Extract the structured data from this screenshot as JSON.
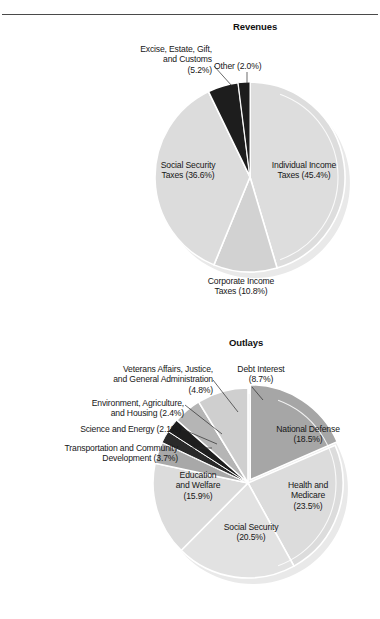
{
  "page": {
    "background_color": "#ffffff",
    "rule_color": "#4a4a4a"
  },
  "charts": [
    {
      "id": "revenues",
      "title": "Revenues"
    },
    {
      "id": "outlays",
      "title": "Outlays"
    }
  ],
  "revenues_labels": {
    "excise": "Excise, Estate, Gift,\nand Customs\n(5.2%)",
    "other": "Other (2.0%)",
    "social_security": "Social Security\nTaxes (36.6%)",
    "individual": "Individual Income\nTaxes (45.4%)",
    "corporate": "Corporate Income\nTaxes (10.8%)"
  },
  "outlays_labels": {
    "veterans": "Veterans Affairs, Justice,\nand General Administration\n(4.8%)",
    "debt_interest": "Debt Interest\n(8.7%)",
    "environment": "Environment, Agriculture,\nand Housing (2.4%)",
    "science": "Science and Energy (2.1%)",
    "transportation": "Transportation and Community\nDevelopment (3.7%)",
    "national_defense": "National Defense\n(18.5%)",
    "health": "Health and\nMedicare\n(23.5%)",
    "social_security": "Social Security\n(20.5%)",
    "education": "Education\nand Welfare\n(15.9%)"
  },
  "chart_data": [
    {
      "type": "pie",
      "title": "Revenues",
      "legend_position": "callout-labels",
      "categories": [
        "Individual Income Taxes",
        "Corporate Income Taxes",
        "Social Security Taxes",
        "Excise, Estate, Gift, and Customs",
        "Other"
      ],
      "values": [
        45.4,
        10.8,
        36.6,
        5.2,
        2.0
      ],
      "value_unit": "percent",
      "labels": [
        "Individual Income Taxes (45.4%)",
        "Corporate Income Taxes (10.8%)",
        "Social Security Taxes (36.6%)",
        "Excise, Estate, Gift, and Customs (5.2%)",
        "Other (2.0%)"
      ],
      "colors": [
        "#dddddd",
        "#d2d2d2",
        "#dcdcdc",
        "#1d1d1d",
        "#1d1d1d"
      ],
      "start_angle_deg": 0,
      "direction": "clockwise",
      "exploded": [
        false,
        false,
        false,
        false,
        false
      ],
      "notes": "3-D style pie with white separating gaps; small dark wedges at top."
    },
    {
      "type": "pie",
      "title": "Outlays",
      "legend_position": "callout-labels",
      "categories": [
        "National Defense",
        "Health and Medicare",
        "Social Security",
        "Education and Welfare",
        "Transportation and Community Development",
        "Science and Energy",
        "Environment, Agriculture, and Housing",
        "Veterans Affairs, Justice, and General Administration",
        "Debt Interest"
      ],
      "values": [
        18.5,
        23.5,
        20.5,
        15.9,
        3.7,
        2.1,
        2.4,
        4.8,
        8.7
      ],
      "value_unit": "percent",
      "labels": [
        "National Defense (18.5%)",
        "Health and Medicare (23.5%)",
        "Social Security (20.5%)",
        "Education and Welfare (15.9%)",
        "Transportation and Community Development (3.7%)",
        "Science and Energy (2.1%)",
        "Environment, Agriculture, and Housing (2.4%)",
        "Veterans Affairs, Justice, and General Administration (4.8%)",
        "Debt Interest (8.7%)"
      ],
      "colors": [
        "#a6a6a6",
        "#dcdcdc",
        "#e2e2e2",
        "#dcdcdc",
        "#a8a8a8",
        "#2a2a2a",
        "#1e1e1e",
        "#b5b5b5",
        "#cfcfcf"
      ],
      "start_angle_deg": 0,
      "direction": "clockwise",
      "exploded": [
        true,
        false,
        false,
        false,
        false,
        false,
        false,
        false,
        false
      ],
      "notes": "National Defense wedge is pulled out slightly and shaded darker gray."
    }
  ]
}
